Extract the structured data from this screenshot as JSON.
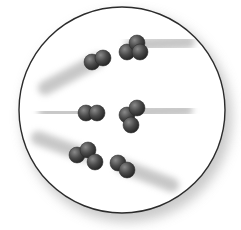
{
  "diagram": {
    "title": "",
    "container": {
      "shape": "circle",
      "cx": 122,
      "cy": 110,
      "r": 103,
      "stroke": "#2b2b2b",
      "fill": "#ffffff",
      "shadow": "#bdbdbd"
    },
    "atom_color": "#4a4a4a",
    "trail_color": "#9a9a9a",
    "molecules": [
      {
        "id": "m1",
        "kind": "diatomic",
        "atoms": [
          [
            92,
            62
          ],
          [
            103,
            58
          ]
        ],
        "trail": {
          "x1": 45,
          "y1": 88,
          "x2": 98,
          "y2": 60
        }
      },
      {
        "id": "m2",
        "kind": "triatomic",
        "atoms": [
          [
            127,
            52
          ],
          [
            137,
            43
          ],
          [
            140,
            52
          ]
        ],
        "trail": {
          "x1": 132,
          "y1": 45,
          "x2": 188,
          "y2": 42
        }
      },
      {
        "id": "m3",
        "kind": "diatomic",
        "atoms": [
          [
            86,
            113
          ],
          [
            97,
            113
          ]
        ],
        "trail": {
          "x1": 45,
          "y1": 112,
          "x2": 92,
          "y2": 113
        }
      },
      {
        "id": "m4",
        "kind": "triatomic",
        "atoms": [
          [
            127,
            115
          ],
          [
            137,
            108
          ],
          [
            131,
            125
          ]
        ],
        "trail": {
          "x1": 132,
          "y1": 112,
          "x2": 186,
          "y2": 110
        }
      },
      {
        "id": "m5",
        "kind": "triatomic",
        "atoms": [
          [
            77,
            155
          ],
          [
            88,
            150
          ],
          [
            95,
            162
          ]
        ],
        "trail": {
          "x1": 38,
          "y1": 138,
          "x2": 85,
          "y2": 155
        }
      },
      {
        "id": "m6",
        "kind": "diatomic",
        "atoms": [
          [
            118,
            163
          ],
          [
            127,
            170
          ]
        ],
        "trail": {
          "x1": 122,
          "y1": 166,
          "x2": 172,
          "y2": 185
        }
      }
    ]
  }
}
